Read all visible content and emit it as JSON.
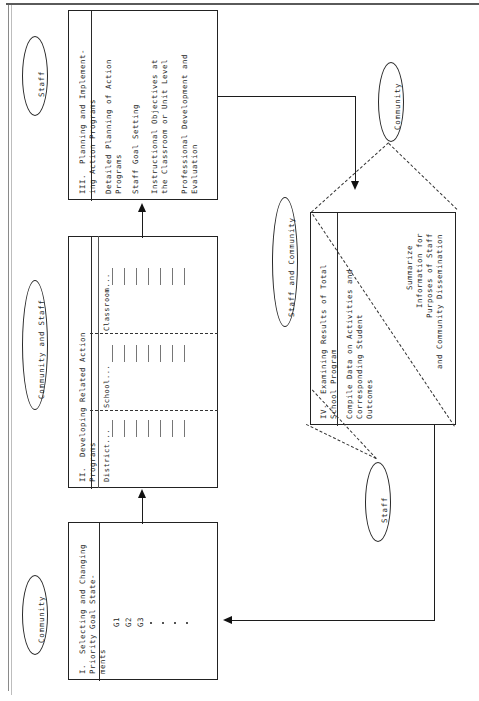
{
  "diagram": {
    "orientation": "rotated-90-ccw",
    "boxes": [
      {
        "id": "box1",
        "number": "I.",
        "title": "Selecting and Changing\nPriority Goal State-\nments",
        "title_lines": [
          "I.  Selecting and Changing",
          "Priority Goal State-",
          "ments"
        ],
        "items": [
          "G1",
          "G2",
          "G3"
        ],
        "ellipsis_dots": 4
      },
      {
        "id": "box2",
        "number": "II.",
        "title_lines": [
          "II.  Developing Related Action",
          "Programs"
        ],
        "columns": [
          "District...",
          "School...",
          "Classroom..."
        ],
        "rows_per_column": 7
      },
      {
        "id": "box3",
        "number": "III.",
        "title_lines": [
          "III.  Planning and Implement-",
          "ing Action Programs"
        ],
        "items": [
          "Detailed Planning of Action\nPrograms",
          "Staff Goal Setting",
          "Instructional Objectives at\nthe Classroom or Unit Level",
          "Professional Development and\nEvaluation"
        ],
        "item_lines": [
          [
            "Detailed Planning of Action",
            "Programs"
          ],
          [
            "Staff Goal Setting"
          ],
          [
            "Instructional Objectives at",
            "the Classroom or Unit Level"
          ],
          [
            "Professional Development and",
            "Evaluation"
          ]
        ]
      },
      {
        "id": "box4",
        "number": "IV.",
        "title_lines": [
          "IV.  Examining Results of Total",
          "School Program"
        ],
        "left_item_lines": [
          "Compile Data on Activities and",
          "Corresponding Student",
          "Outcomes"
        ],
        "right_item_lines": [
          "Summarize",
          "Information for",
          "Purposes of Staff",
          "and Community Dissemination"
        ]
      }
    ],
    "ovals": [
      {
        "id": "oval-staff-top",
        "label": "Staff"
      },
      {
        "id": "oval-community-and-staff",
        "label": "Community and Staff"
      },
      {
        "id": "oval-community-left",
        "label": "Community"
      },
      {
        "id": "oval-community-right",
        "label": "Community"
      },
      {
        "id": "oval-staff-and-community",
        "label": "Staff and Community"
      },
      {
        "id": "oval-staff-bottom",
        "label": "Staff"
      }
    ],
    "colors": {
      "ink": "#1d1d1d",
      "line": "#1c1c1c",
      "frame": "#8a8a8a",
      "tick": "#767676",
      "paper": "#ffffff"
    }
  }
}
